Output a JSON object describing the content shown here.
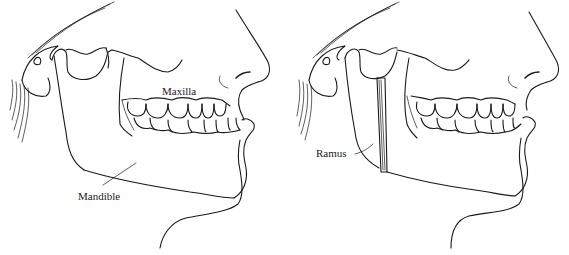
{
  "figure": {
    "panels": [
      {
        "id": "preoperative",
        "labels": [
          {
            "text": "Maxilla",
            "x": 162,
            "y": 86
          },
          {
            "text": "Mandible",
            "x": 78,
            "y": 191
          }
        ]
      },
      {
        "id": "ramus-osteotomy",
        "labels": [
          {
            "text": "Ramus",
            "x": 316,
            "y": 148
          }
        ]
      }
    ]
  },
  "colors": {
    "line": "#1a1a1a",
    "background": "#ffffff"
  }
}
